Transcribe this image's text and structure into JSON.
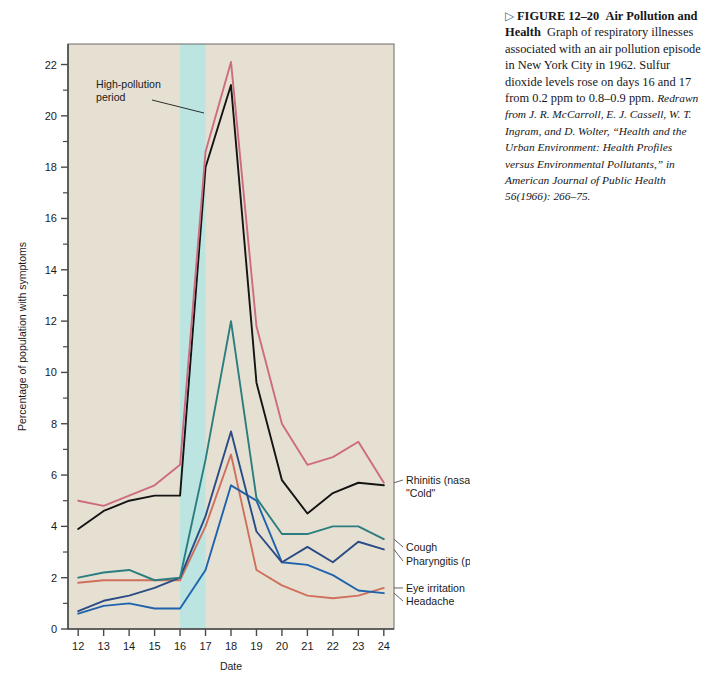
{
  "figure": {
    "marker": "▷",
    "label": "FIGURE 12–20",
    "title": "Air Pollution and Health",
    "body": "Graph of respiratory illnesses associated with an air pollution episode in New York City in 1962. Sulfur dioxide levels rose on days 16 and 17 from 0.2 ppm to 0.8–0.9 ppm.",
    "source": "Redrawn from J. R. McCarroll, E. J. Cassell, W. T. Ingram, and D. Wolter, “Health and the Urban Environment: Health Profiles versus Environmental Pollutants,” in American Journal of Public Health 56(1966): 266–75."
  },
  "annotation": {
    "text_line1": "High-pollution",
    "text_line2": "period"
  },
  "colors": {
    "plot_background": "#e6e0d2",
    "band_highlight": "#b8e4e2",
    "rhinitis": "#cd6c7e",
    "cold": "#141414",
    "cough": "#2b7d80",
    "pharyngitis": "#2b4b86",
    "eye_irritation": "#d0705c",
    "headache": "#1f63ad",
    "axis": "#4a4a4a"
  },
  "chart_data": {
    "type": "line",
    "title": "",
    "xlabel": "Date",
    "ylabel": "Percentage of population with symptoms",
    "x": [
      12,
      13,
      14,
      15,
      16,
      17,
      18,
      19,
      20,
      21,
      22,
      23,
      24
    ],
    "xlim": [
      11.6,
      24.4
    ],
    "ylim": [
      0,
      22.8
    ],
    "yticks_major": [
      0,
      2,
      4,
      6,
      8,
      10,
      12,
      14,
      16,
      18,
      20,
      22
    ],
    "yticks_minor": [
      1,
      3,
      5,
      7,
      9,
      11,
      13,
      15,
      17,
      19,
      21
    ],
    "xticks": [
      12,
      13,
      14,
      15,
      16,
      17,
      18,
      19,
      20,
      21,
      22,
      23,
      24
    ],
    "grid": false,
    "legend": "inline-right",
    "shaded_band": {
      "label": "High-pollution period",
      "x_start": 16,
      "x_end": 17
    },
    "series": [
      {
        "name": "Rhinitis (nasal infection)",
        "label_line1": "Rhinitis (nasal infection)",
        "label_line2": "\"Cold\"",
        "color_key": "rhinitis",
        "values": [
          5.0,
          4.8,
          5.2,
          5.6,
          6.4,
          18.6,
          22.1,
          11.8,
          8.0,
          6.4,
          6.7,
          7.3,
          5.7
        ]
      },
      {
        "name": "\"Cold\"",
        "label_line1": "",
        "label_line2": "",
        "color_key": "cold",
        "values": [
          3.9,
          4.6,
          5.0,
          5.2,
          5.2,
          18.0,
          21.2,
          9.6,
          5.8,
          4.5,
          5.3,
          5.7,
          5.6
        ]
      },
      {
        "name": "Cough",
        "label_line1": "Cough",
        "label_line2": "",
        "color_key": "cough",
        "values": [
          2.0,
          2.2,
          2.3,
          1.9,
          2.0,
          6.6,
          12.0,
          5.1,
          3.7,
          3.7,
          4.0,
          4.0,
          3.5
        ]
      },
      {
        "name": "Pharyngitis (pharyngeal infection)",
        "label_line1": "Pharyngitis (pharyngeal infection)",
        "label_line2": "",
        "color_key": "pharyngitis",
        "values": [
          0.7,
          1.1,
          1.3,
          1.6,
          2.0,
          4.4,
          7.7,
          3.8,
          2.6,
          3.2,
          2.6,
          3.4,
          3.1
        ]
      },
      {
        "name": "Eye irritation",
        "label_line1": "Eye irritation",
        "label_line2": "",
        "color_key": "eye_irritation",
        "values": [
          1.8,
          1.9,
          1.9,
          1.9,
          1.9,
          4.0,
          6.8,
          2.3,
          1.7,
          1.3,
          1.2,
          1.3,
          1.6
        ]
      },
      {
        "name": "Headache",
        "label_line1": "Headache",
        "label_line2": "",
        "color_key": "headache",
        "values": [
          0.6,
          0.9,
          1.0,
          0.8,
          0.8,
          2.3,
          5.6,
          5.0,
          2.6,
          2.5,
          2.1,
          1.5,
          1.4
        ]
      }
    ]
  }
}
